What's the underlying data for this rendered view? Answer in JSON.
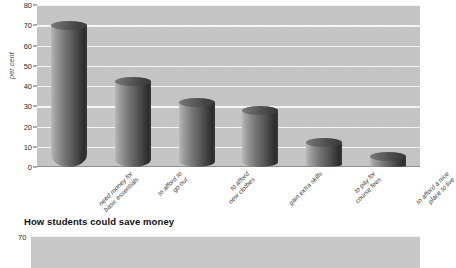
{
  "chart_data": [
    {
      "type": "bar",
      "title": "",
      "xlabel": "",
      "ylabel": "per cent",
      "ylim": [
        0,
        80
      ],
      "yticks": [
        0,
        10,
        20,
        30,
        40,
        50,
        60,
        70,
        80
      ],
      "grid": true,
      "legend": "none",
      "style": "3d-cylinder-bars-grayscale",
      "categories": [
        "need money for basic essentials",
        "to afford to go out",
        "to afford new clothes",
        "gain extra skills",
        "to pay for course fees",
        "to afford a nice place to live"
      ],
      "category_lines": [
        [
          "need money for",
          "basic essentials"
        ],
        [
          "to afford to",
          "go out"
        ],
        [
          "to afford",
          "new clothes"
        ],
        [
          "gain extra skills"
        ],
        [
          "to pay for",
          "course fees"
        ],
        [
          "to afford a nice",
          "place to live"
        ]
      ],
      "values": [
        70,
        42,
        32,
        28,
        12,
        5
      ]
    },
    {
      "type": "bar",
      "title": "How students could save money",
      "ylabel": "",
      "ylim": [
        0,
        70
      ],
      "yticks": [
        70
      ],
      "visible_yticks": [
        "70"
      ],
      "grid": true,
      "note": "chart cropped at bottom edge of screenshot",
      "categories": [],
      "values": []
    }
  ],
  "chart1": {
    "axis_title": "per cent",
    "ytick_labels": [
      "80",
      "70",
      "60",
      "50",
      "40",
      "30",
      "20",
      "10",
      "0"
    ]
  },
  "chart2": {
    "title": "How students could save money",
    "first_ytick": "70"
  },
  "colors": {
    "plot_background": "#c2c2c2",
    "gridline": "#f4f4f4",
    "bar_light": "#b9b9b9",
    "bar_dark": "#2c2c2c",
    "text": "#2b2b2b",
    "page_background": "#ffffff"
  }
}
